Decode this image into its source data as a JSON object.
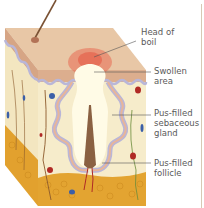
{
  "diagram": {
    "labels": [
      {
        "id": "head",
        "text": "Head of\nboil",
        "x": 141,
        "y": 27
      },
      {
        "id": "swollen",
        "text": "Swollen\narea",
        "x": 154,
        "y": 66
      },
      {
        "id": "gland",
        "text": "Pus-filled\nsebaceous\ngland",
        "x": 154,
        "y": 108
      },
      {
        "id": "follicle",
        "text": "Pus-filled\nfollicle",
        "x": 154,
        "y": 158
      }
    ],
    "colors": {
      "skin_top": "#e8c7a6",
      "epidermis": "#d9a98a",
      "wavy_layer": "#b9b6d8",
      "dermis": "#f5ecc8",
      "fat": "#e3a431",
      "boil_head": "#e86a52",
      "pus": "#fffbe6",
      "hair": "#8a6142",
      "leader_line": "#555555",
      "vessel": "#8c5a2b",
      "blood_cell": "#b02a25",
      "blue_cell": "#3b5fa8"
    }
  }
}
